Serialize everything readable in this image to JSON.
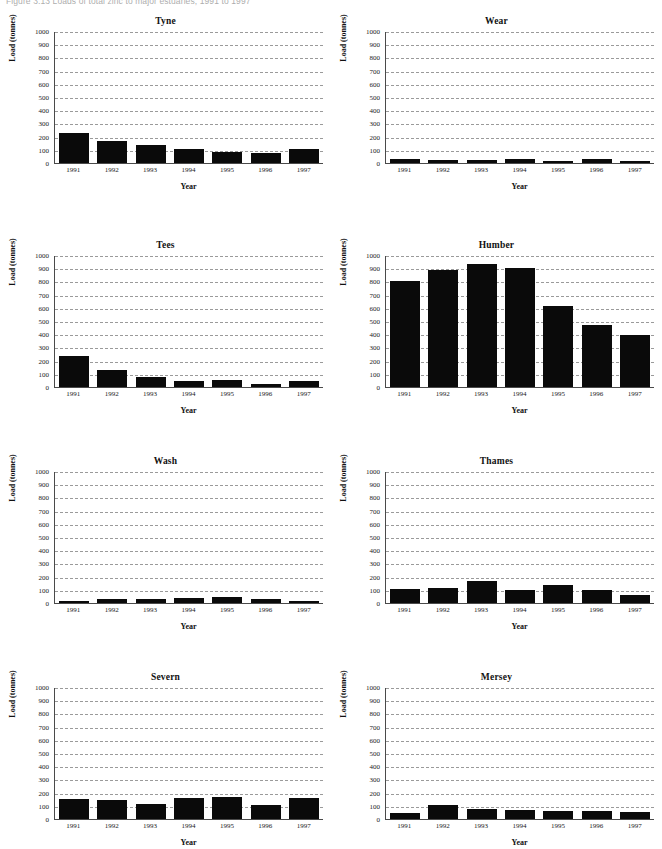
{
  "figure": {
    "caption": "Figure 3.13   Loads of total zinc to major estuaries, 1991 to 1997"
  },
  "axis": {
    "ylabel": "Load (tonnes)",
    "xlabel": "Year",
    "yticks": [
      0,
      100,
      200,
      300,
      400,
      500,
      600,
      700,
      800,
      900,
      1000
    ],
    "ymin": 0,
    "ymax": 1000
  },
  "chart_data": [
    {
      "type": "bar",
      "title": "Tyne",
      "categories": [
        "1991",
        "1992",
        "1993",
        "1994",
        "1995",
        "1996",
        "1997"
      ],
      "values": [
        230,
        165,
        140,
        105,
        85,
        75,
        105
      ],
      "xlabel": "Year",
      "ylabel": "Load (tonnes)",
      "ylim": [
        0,
        1000
      ],
      "grid": true,
      "legend": "none"
    },
    {
      "type": "bar",
      "title": "Wear",
      "categories": [
        "1991",
        "1992",
        "1993",
        "1994",
        "1995",
        "1996",
        "1997"
      ],
      "values": [
        30,
        25,
        22,
        28,
        15,
        30,
        12
      ],
      "xlabel": "Year",
      "ylabel": "Load (tonnes)",
      "ylim": [
        0,
        1000
      ],
      "grid": true,
      "legend": "none"
    },
    {
      "type": "bar",
      "title": "Tees",
      "categories": [
        "1991",
        "1992",
        "1993",
        "1994",
        "1995",
        "1996",
        "1997"
      ],
      "values": [
        235,
        130,
        75,
        42,
        55,
        25,
        45
      ],
      "xlabel": "Year",
      "ylabel": "Load (tonnes)",
      "ylim": [
        0,
        1000
      ],
      "grid": true,
      "legend": "none"
    },
    {
      "type": "bar",
      "title": "Humber",
      "categories": [
        "1991",
        "1992",
        "1993",
        "1994",
        "1995",
        "1996",
        "1997"
      ],
      "values": [
        800,
        885,
        935,
        905,
        615,
        470,
        395
      ],
      "xlabel": "Year",
      "ylabel": "Load (tonnes)",
      "ylim": [
        0,
        1000
      ],
      "grid": true,
      "legend": "none"
    },
    {
      "type": "bar",
      "title": "Wash",
      "categories": [
        "1991",
        "1992",
        "1993",
        "1994",
        "1995",
        "1996",
        "1997"
      ],
      "values": [
        12,
        32,
        32,
        38,
        45,
        28,
        15
      ],
      "xlabel": "Year",
      "ylabel": "Load (tonnes)",
      "ylim": [
        0,
        1000
      ],
      "grid": true,
      "legend": "none"
    },
    {
      "type": "bar",
      "title": "Thames",
      "categories": [
        "1991",
        "1992",
        "1993",
        "1994",
        "1995",
        "1996",
        "1997"
      ],
      "values": [
        105,
        115,
        165,
        95,
        135,
        98,
        62
      ],
      "xlabel": "Year",
      "ylabel": "Load (tonnes)",
      "ylim": [
        0,
        1000
      ],
      "grid": true,
      "legend": "none"
    },
    {
      "type": "bar",
      "title": "Severn",
      "categories": [
        "1991",
        "1992",
        "1993",
        "1994",
        "1995",
        "1996",
        "1997"
      ],
      "values": [
        148,
        145,
        115,
        160,
        165,
        105,
        158
      ],
      "xlabel": "Year",
      "ylabel": "Load (tonnes)",
      "ylim": [
        0,
        1000
      ],
      "grid": true,
      "legend": "none"
    },
    {
      "type": "bar",
      "title": "Mersey",
      "categories": [
        "1991",
        "1992",
        "1993",
        "1994",
        "1995",
        "1996",
        "1997"
      ],
      "values": [
        45,
        108,
        78,
        72,
        62,
        58,
        50
      ],
      "xlabel": "Year",
      "ylabel": "Load (tonnes)",
      "ylim": [
        0,
        1000
      ],
      "grid": true,
      "legend": "none"
    }
  ]
}
